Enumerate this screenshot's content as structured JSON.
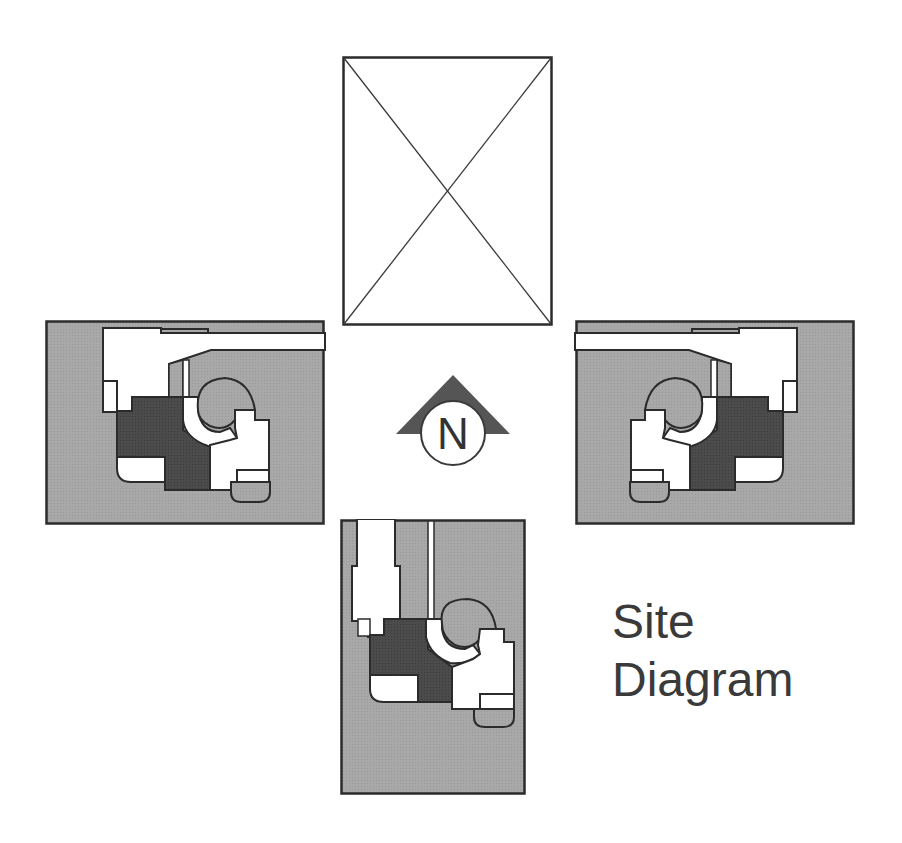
{
  "diagram": {
    "title_line1": "Site",
    "title_line2": "Diagram",
    "north_label": "N",
    "placeholder_caption": "image placeholder",
    "colors": {
      "background": "#ffffff",
      "site_gray": "#a6a6a6",
      "building_dark": "#4a4a4a",
      "open_white": "#ffffff",
      "stroke": "#2b2b2b",
      "arrow_fill": "#555555",
      "text": "#3a3a3a"
    },
    "panels": [
      {
        "id": "top",
        "type": "placeholder",
        "label": "empty image frame with diagonal cross"
      },
      {
        "id": "left",
        "type": "site-plan",
        "orientation": "west"
      },
      {
        "id": "right",
        "type": "site-plan",
        "orientation": "east (mirrored)"
      },
      {
        "id": "bottom",
        "type": "site-plan",
        "orientation": "south (rotated)"
      }
    ]
  }
}
